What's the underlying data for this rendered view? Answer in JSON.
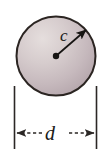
{
  "figure": {
    "type": "geometry-diagram",
    "background_color": "#ffffff",
    "labels": {
      "radius": "c",
      "diameter": "d"
    },
    "circle": {
      "name": "shaded-circle",
      "center_x": 56,
      "center_y": 56,
      "radius": 40,
      "fill_light": "#ded6d6",
      "fill_mid": "#c9bdc0",
      "fill_dark": "#b5a7ac",
      "stroke_color": "#2b2522",
      "stroke_width": 2
    },
    "radius_arrow": {
      "name": "radius-arrow",
      "from_x": 56,
      "from_y": 56,
      "to_x": 87,
      "to_y": 29,
      "color": "#171513",
      "center_dot_radius": 3.2
    },
    "dimension": {
      "name": "diameter-dimension",
      "left_extension_x": 14,
      "right_extension_x": 97,
      "extension_top_y": 86,
      "extension_bottom_y": 149,
      "arrow_line_y": 133,
      "color": "#2b2725"
    }
  }
}
